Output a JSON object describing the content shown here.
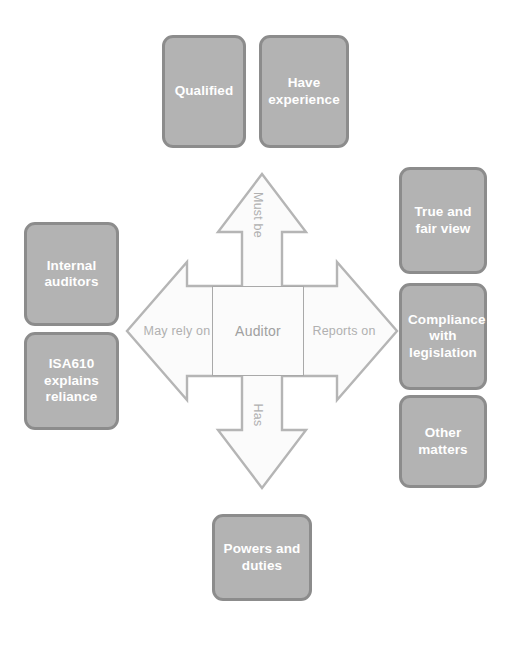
{
  "diagram": {
    "title": "Auditor",
    "center": {
      "label": "Auditor"
    },
    "colors": {
      "box_fill": "#b3b3b3",
      "box_border": "#8c8c8c",
      "box_text": "#ffffff",
      "arrow_fill": "#fbfbfb",
      "arrow_border": "#b5b5b5",
      "arrow_text": "#b0b0b0",
      "center_text": "#a0a0a0",
      "background": "#ffffff"
    },
    "arrows": [
      {
        "direction": "up",
        "label": "Must be"
      },
      {
        "direction": "right",
        "label": "Reports on"
      },
      {
        "direction": "down",
        "label": "Has"
      },
      {
        "direction": "left",
        "label": "May rely on"
      }
    ],
    "groups": {
      "top": {
        "relation": "Must be",
        "boxes": [
          {
            "label": "Qualified"
          },
          {
            "label": "Have\nexperience"
          }
        ]
      },
      "right": {
        "relation": "Reports on",
        "boxes": [
          {
            "label": "True and\nfair view"
          },
          {
            "label": "Compliance\nwith\nlegislation"
          },
          {
            "label": "Other\nmatters"
          }
        ]
      },
      "left": {
        "relation": "May rely on",
        "boxes": [
          {
            "label": "Internal\nauditors"
          },
          {
            "label": "ISA610\nexplains\nreliance"
          }
        ]
      },
      "bottom": {
        "relation": "Has",
        "boxes": [
          {
            "label": "Powers and\nduties"
          }
        ]
      }
    }
  }
}
